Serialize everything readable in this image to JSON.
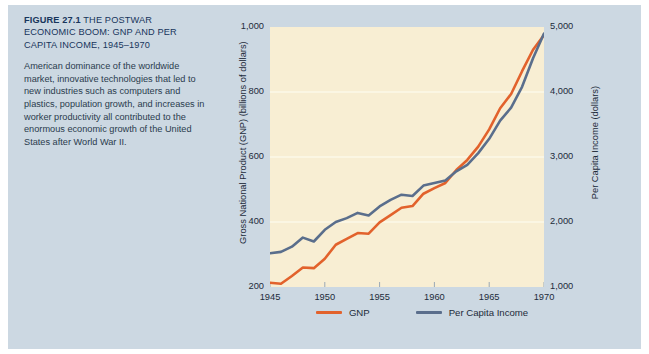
{
  "caption": {
    "figure_number": "FIGURE 27.1",
    "title": "THE POSTWAR ECONOMIC BOOM: GNP AND PER CAPITA INCOME, 1945–1970",
    "body": "American dominance of the worldwide market, innovative technologies that led to new industries such as computers and plastics, population growth, and increases in worker productivity all contributed to the enormous economic growth of the United States after World War II."
  },
  "colors": {
    "panel_background": "#ccd8e2",
    "plot_background": "#f8eed3",
    "gnp_line": "#e2622c",
    "per_capita_line": "#5a6e8c",
    "title_text": "#17355c",
    "body_text": "#2a3b4d",
    "gridline": "#fdf8e8"
  },
  "chart_data": {
    "type": "line",
    "title": "THE POSTWAR ECONOMIC BOOM: GNP AND PER CAPITA INCOME, 1945–1970",
    "xlabel": "",
    "ylabel": "Gross National Product (GNP) (billions of dollars)",
    "y2label": "Per Capita Income (dollars)",
    "xlim": [
      1945,
      1970
    ],
    "ylim": [
      200,
      1000
    ],
    "y2lim": [
      1000,
      5000
    ],
    "grid": true,
    "legend_position": "bottom",
    "x_ticks": [
      "1945",
      "1950",
      "1955",
      "1960",
      "1965",
      "1970"
    ],
    "x_tick_values": [
      1945,
      1950,
      1955,
      1960,
      1965,
      1970
    ],
    "y_ticks_left": [
      "200",
      "400",
      "600",
      "800",
      "1,000"
    ],
    "y_tick_values_left": [
      200,
      400,
      600,
      800,
      1000
    ],
    "y_ticks_right": [
      "1,000",
      "2,000",
      "3,000",
      "4,000",
      "5,000"
    ],
    "y_tick_values_right": [
      1000,
      2000,
      3000,
      4000,
      5000
    ],
    "x": [
      1945,
      1946,
      1947,
      1948,
      1949,
      1950,
      1951,
      1952,
      1953,
      1954,
      1955,
      1956,
      1957,
      1958,
      1959,
      1960,
      1961,
      1962,
      1963,
      1964,
      1965,
      1966,
      1967,
      1968,
      1969,
      1970
    ],
    "series": [
      {
        "name": "GNP",
        "axis": "left",
        "units": "billions of dollars",
        "color": "#e2622c",
        "values": [
          213,
          210,
          234,
          260,
          258,
          287,
          330,
          348,
          366,
          364,
          399,
          421,
          444,
          449,
          487,
          504,
          520,
          560,
          591,
          632,
          685,
          750,
          794,
          864,
          930,
          975
        ]
      },
      {
        "name": "Per Capita Income",
        "axis": "right",
        "units": "dollars",
        "color": "#5a6e8c",
        "values": [
          1520,
          1540,
          1620,
          1760,
          1700,
          1880,
          2000,
          2060,
          2140,
          2100,
          2240,
          2340,
          2420,
          2400,
          2560,
          2600,
          2640,
          2780,
          2880,
          3060,
          3280,
          3560,
          3760,
          4080,
          4520,
          4900
        ]
      }
    ]
  },
  "legend": [
    {
      "label": "GNP",
      "color": "#e2622c"
    },
    {
      "label": "Per Capita Income",
      "color": "#5a6e8c"
    }
  ]
}
